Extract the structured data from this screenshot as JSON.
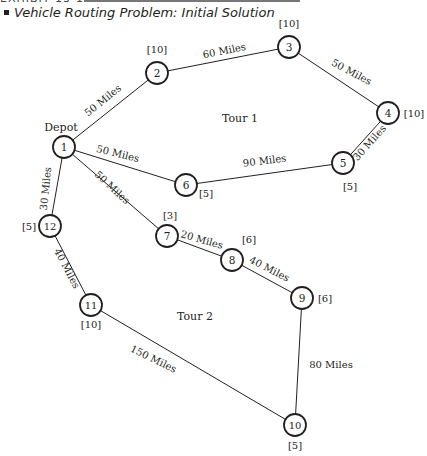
{
  "header": {
    "exhibit_label": "EXHIBIT 13-11",
    "title": "Vehicle Routing Problem: Initial Solution"
  },
  "diagram": {
    "depot_label": "Depot",
    "tour_labels": [
      {
        "id": "tour1",
        "label": "Tour 1",
        "x": 240,
        "y": 122
      },
      {
        "id": "tour2",
        "label": "Tour 2",
        "x": 195,
        "y": 320
      }
    ],
    "nodes": [
      {
        "id": "1",
        "x": 64,
        "y": 147,
        "demand": "",
        "demand_x": 0,
        "demand_y": 0
      },
      {
        "id": "2",
        "x": 157,
        "y": 73,
        "demand": "[10]",
        "demand_x": 157,
        "demand_y": 53
      },
      {
        "id": "3",
        "x": 289,
        "y": 47,
        "demand": "[10]",
        "demand_x": 289,
        "demand_y": 27
      },
      {
        "id": "4",
        "x": 388,
        "y": 113,
        "demand": "[10]",
        "demand_x": 414,
        "demand_y": 117
      },
      {
        "id": "5",
        "x": 343,
        "y": 163,
        "demand": "[5]",
        "demand_x": 350,
        "demand_y": 190
      },
      {
        "id": "6",
        "x": 186,
        "y": 185,
        "demand": "[5]",
        "demand_x": 206,
        "demand_y": 197
      },
      {
        "id": "7",
        "x": 167,
        "y": 236,
        "demand": "[3]",
        "demand_x": 170,
        "demand_y": 219
      },
      {
        "id": "8",
        "x": 232,
        "y": 260,
        "demand": "[6]",
        "demand_x": 249,
        "demand_y": 243
      },
      {
        "id": "9",
        "x": 302,
        "y": 298,
        "demand": "[6]",
        "demand_x": 325,
        "demand_y": 302
      },
      {
        "id": "10",
        "x": 295,
        "y": 425,
        "demand": "[5]",
        "demand_x": 295,
        "demand_y": 449
      },
      {
        "id": "11",
        "x": 91,
        "y": 305,
        "demand": "[10]",
        "demand_x": 91,
        "demand_y": 328
      },
      {
        "id": "12",
        "x": 50,
        "y": 226,
        "demand": "[5]",
        "demand_x": 29,
        "demand_y": 230
      }
    ],
    "edges": [
      {
        "from": "1",
        "to": "2",
        "label": "50 Miles",
        "lx": 105,
        "ly": 103,
        "angle": -39
      },
      {
        "from": "2",
        "to": "3",
        "label": "60 Miles",
        "lx": 225,
        "ly": 54,
        "angle": -11
      },
      {
        "from": "3",
        "to": "4",
        "label": "50 Miles",
        "lx": 350,
        "ly": 75,
        "angle": 28
      },
      {
        "from": "4",
        "to": "5",
        "label": "30 Miles",
        "lx": 372,
        "ly": 145,
        "angle": -48
      },
      {
        "from": "5",
        "to": "6",
        "label": "90 Miles",
        "lx": 265,
        "ly": 164,
        "angle": -7
      },
      {
        "from": "6",
        "to": "1",
        "label": "50 Miles",
        "lx": 117,
        "ly": 157,
        "angle": 14
      },
      {
        "from": "1",
        "to": "7",
        "label": "50 Miles",
        "lx": 110,
        "ly": 190,
        "angle": 43
      },
      {
        "from": "7",
        "to": "8",
        "label": "20 Miles",
        "lx": 201,
        "ly": 243,
        "angle": 16
      },
      {
        "from": "8",
        "to": "9",
        "label": "40 Miles",
        "lx": 268,
        "ly": 272,
        "angle": 27
      },
      {
        "from": "9",
        "to": "10",
        "label": "80 Miles",
        "lx": 331,
        "ly": 368,
        "angle": 0
      },
      {
        "from": "10",
        "to": "11",
        "label": "150 Miles",
        "lx": 152,
        "ly": 362,
        "angle": 26
      },
      {
        "from": "11",
        "to": "12",
        "label": "40 Miles",
        "lx": 64,
        "ly": 270,
        "angle": 62
      },
      {
        "from": "12",
        "to": "1",
        "label": "30 Miles",
        "lx": 49,
        "ly": 189,
        "angle": -84
      }
    ]
  }
}
